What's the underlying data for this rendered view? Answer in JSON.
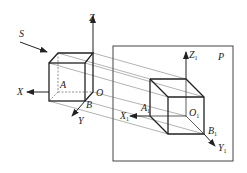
{
  "diagram": {
    "title": "",
    "colors": {
      "line": "#222222",
      "thin_line": "#555555",
      "background": "#ffffff"
    },
    "labels": {
      "projection_direction": "S",
      "axis_z": "Z",
      "axis_x": "X",
      "axis_y": "Y",
      "origin": "O",
      "point_a": "A",
      "point_b": "B",
      "plane": "P",
      "axis_z1": "Z",
      "axis_z1_sub": "1",
      "axis_x1": "X",
      "axis_x1_sub": "1",
      "axis_y1": "Y",
      "axis_y1_sub": "1",
      "origin1": "O",
      "origin1_sub": "1",
      "point_a1": "A",
      "point_a1_sub": "1",
      "point_b1": "B",
      "point_b1_sub": "1"
    }
  }
}
